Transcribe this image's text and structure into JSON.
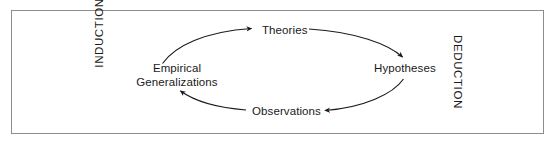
{
  "figure": {
    "type": "cycle-diagram",
    "frame": {
      "border_color": "#8c8c8c",
      "background": "#ffffff"
    },
    "stroke_color": "#1a1a1a",
    "text_color": "#1a1a1a"
  },
  "side_labels": {
    "left": "INDUCTION",
    "right": "DEDUCTION"
  },
  "nodes": {
    "theories": "Theories",
    "hypotheses": "Hypotheses",
    "observations": "Observations",
    "empirical_generalizations": {
      "line1": "Empirical",
      "line2": "Generalizations"
    }
  },
  "arrows": [
    {
      "name": "empirical-to-theories",
      "from": "Empirical Generalizations",
      "to": "Theories",
      "direction": "clockwise"
    },
    {
      "name": "theories-to-hypotheses",
      "from": "Theories",
      "to": "Hypotheses",
      "direction": "clockwise"
    },
    {
      "name": "hypotheses-to-observations",
      "from": "Hypotheses",
      "to": "Observations",
      "direction": "clockwise"
    },
    {
      "name": "observations-to-empirical",
      "from": "Observations",
      "to": "Empirical Generalizations",
      "direction": "clockwise"
    }
  ]
}
